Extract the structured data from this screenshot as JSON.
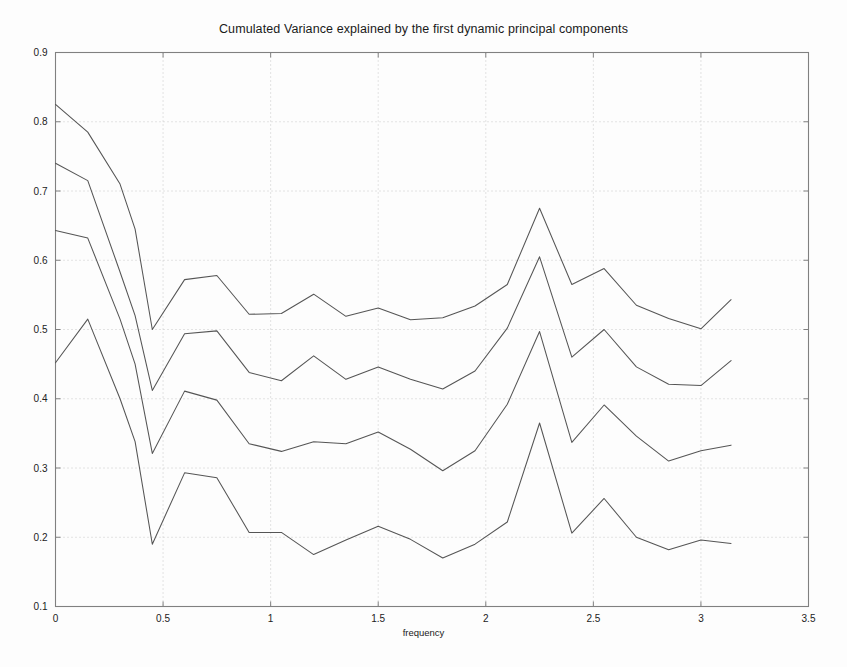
{
  "chart_data": {
    "type": "line",
    "title": "Cumulated Variance explained by the first dynamic principal components",
    "xlabel": "frequency",
    "ylabel": "",
    "xlim": [
      0,
      3.5
    ],
    "ylim": [
      0.1,
      0.9
    ],
    "xticks": [
      0,
      0.5,
      1,
      1.5,
      2,
      2.5,
      3,
      3.5
    ],
    "xtick_labels": [
      "0",
      "0.5",
      "1",
      "1.5",
      "2",
      "2.5",
      "3",
      "3.5"
    ],
    "yticks": [
      0.1,
      0.2,
      0.3,
      0.4,
      0.5,
      0.6,
      0.7,
      0.8,
      0.9
    ],
    "ytick_labels": [
      "0.1",
      "0.2",
      "0.3",
      "0.4",
      "0.5",
      "0.6",
      "0.7",
      "0.8",
      "0.9"
    ],
    "grid": true,
    "grid_style": "dotted",
    "legend": null,
    "legend_position": "none",
    "line_color": "#555555",
    "grid_color": "#c8c8c8",
    "axis_color": "#808080",
    "background_color": "#fdfdfd",
    "x": [
      0,
      0.15,
      0.3,
      0.37,
      0.45,
      0.6,
      0.75,
      0.9,
      1.05,
      1.2,
      1.35,
      1.5,
      1.65,
      1.8,
      1.95,
      2.1,
      2.25,
      2.4,
      2.55,
      2.7,
      2.85,
      3.0,
      3.14
    ],
    "series": [
      {
        "name": "component 4",
        "values": [
          0.825,
          0.785,
          0.71,
          0.645,
          0.5,
          0.572,
          0.578,
          0.522,
          0.523,
          0.551,
          0.519,
          0.531,
          0.514,
          0.517,
          0.534,
          0.565,
          0.675,
          0.565,
          0.588,
          0.535,
          0.516,
          0.501,
          0.543
        ]
      },
      {
        "name": "component 3",
        "values": [
          0.74,
          0.715,
          0.583,
          0.52,
          0.412,
          0.494,
          0.498,
          0.438,
          0.426,
          0.462,
          0.428,
          0.446,
          0.428,
          0.414,
          0.44,
          0.502,
          0.605,
          0.46,
          0.5,
          0.446,
          0.421,
          0.419,
          0.455
        ]
      },
      {
        "name": "component 2",
        "values": [
          0.643,
          0.632,
          0.515,
          0.45,
          0.321,
          0.411,
          0.398,
          0.335,
          0.324,
          0.338,
          0.335,
          0.352,
          0.327,
          0.296,
          0.325,
          0.392,
          0.497,
          0.337,
          0.391,
          0.346,
          0.31,
          0.325,
          0.333
        ]
      },
      {
        "name": "component 1",
        "values": [
          0.452,
          0.515,
          0.4,
          0.338,
          0.19,
          0.293,
          0.286,
          0.207,
          0.207,
          0.175,
          0.196,
          0.216,
          0.197,
          0.17,
          0.19,
          0.222,
          0.365,
          0.206,
          0.256,
          0.2,
          0.182,
          0.196,
          0.191
        ]
      }
    ]
  }
}
